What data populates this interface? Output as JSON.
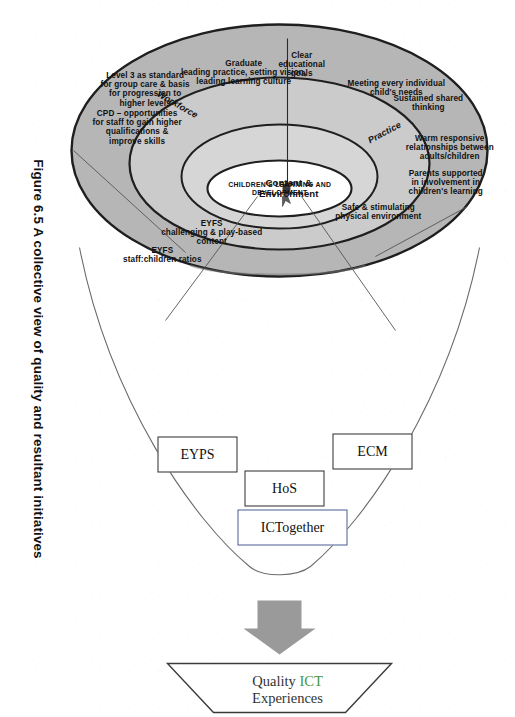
{
  "figure": {
    "caption": "Figure 6.5 A collective view of quality and resultant initiatives",
    "center_label": "CHILDREN'S LEARNING AND DEVELOPMENT",
    "rings": [
      {
        "name": "workforce",
        "label": "Workforce"
      },
      {
        "name": "practice",
        "label": "Practice"
      },
      {
        "name": "content-environment",
        "label": "Content &\nEnvironment"
      }
    ],
    "workforce_items": [
      "Graduate\nleading practice, setting vision,\nleading learning culture",
      "Level 3 as standard\nfor group care & basis\nfor progression to\nhigher levels",
      "CPD – opportunities\nfor staff to gain higher\nqualifications &\nimprove skills"
    ],
    "practice_items": [
      "Clear\neducational\ngoals",
      "Meeting every individual\nchild's needs",
      "Sustained shared\nthinking",
      "Warm responsive\nrelationships between\nadults/children",
      "Parents supported\nin involvement in\nchildren's learning"
    ],
    "content_items": [
      "Safe & stimulating\nphysical environment",
      "EYFS\nchallenging & play-based\ncontent",
      "EYFS\nstaff:children ratios"
    ],
    "initiative_boxes": [
      {
        "name": "eyps",
        "label": "EYPS",
        "accent": false
      },
      {
        "name": "hos",
        "label": "HoS",
        "accent": false
      },
      {
        "name": "ecm",
        "label": "ECM",
        "accent": false
      },
      {
        "name": "ictogether",
        "label": "ICTogether",
        "accent": true
      }
    ],
    "outcome": {
      "pre": "Quality ",
      "highlight": "ICT",
      "post": "",
      "line2": "Experiences"
    },
    "colors": {
      "outer_ring": "#b4b4b4",
      "mid_ring": "#c9c9c9",
      "inner_ring": "#d3d3d3",
      "core": "#ffffff",
      "stroke": "#1f1f1f",
      "arrow": "#9a9a9a",
      "accent_green": "#3f9a3f",
      "accent_blue": "#4a5d8f"
    }
  }
}
